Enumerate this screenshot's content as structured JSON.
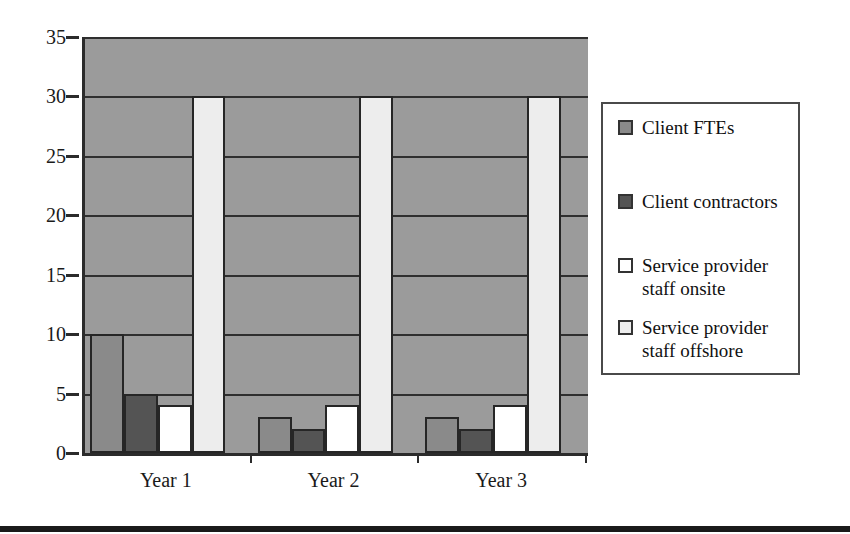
{
  "chart_data": {
    "type": "bar",
    "title": "",
    "subtitle": "",
    "xlabel": "",
    "ylabel": "",
    "categories": [
      "Year 1",
      "Year 2",
      "Year 3"
    ],
    "series": [
      {
        "name": "Client FTEs",
        "color": "#8a8a8a",
        "values": [
          10,
          3,
          3
        ]
      },
      {
        "name": "Client contractors",
        "color": "#545454",
        "values": [
          5,
          2,
          2
        ]
      },
      {
        "name": "Service provider staff onsite",
        "color": "#ffffff",
        "values": [
          4,
          4,
          4
        ]
      },
      {
        "name": "Service provider staff offshore",
        "color": "#ededed",
        "values": [
          30,
          30,
          30
        ]
      }
    ],
    "ylim": [
      0,
      35
    ],
    "y_ticks": [
      0,
      5,
      10,
      15,
      20,
      25,
      30,
      35
    ],
    "y_tick_labels": [
      "0",
      "5",
      "10",
      "15",
      "20",
      "25",
      "30",
      "35"
    ],
    "grid": true,
    "grid_axis": "y",
    "legend_position": "right",
    "plot_background": "#9b9b9b",
    "axis_color": "#2b2b2b",
    "bar_edge_color": "#262626"
  },
  "legend": {
    "entries": [
      {
        "label": "Client FTEs",
        "swatch": "#8a8a8a"
      },
      {
        "label": "Client contractors",
        "swatch": "#545454"
      },
      {
        "label": "Service provider staff onsite",
        "swatch": "#ffffff"
      },
      {
        "label": "Service provider staff offshore",
        "swatch": "#ededed"
      }
    ]
  }
}
